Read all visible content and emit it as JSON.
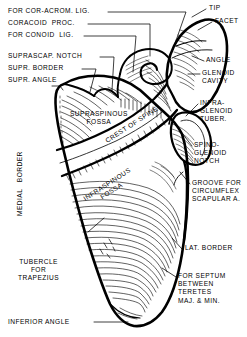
{
  "figure": {
    "view": "posterior",
    "bone": "scapula",
    "style": "line drawing with hatched shading",
    "ink_color": "#000000",
    "background_color": "#ffffff"
  },
  "labels": {
    "for_cor_acrom_lig": "FOR COR-ACROM. LIG.",
    "coracoid_proc": "CORACOID  PROC.",
    "for_conoid_lig": "FOR CONOID  LIG.",
    "suprascap_notch": "SUPRASCAP. NOTCH",
    "supr_border": "SUPR. BORDER",
    "supr_angle": "SUPR. ANGLE",
    "tip": "TIP",
    "facet": "FACET",
    "acromion": "ACROMION",
    "angle": "ANGLE",
    "glenoid_cavity": "GLENOID\nCAVITY",
    "infraglenoid_tuber": "INFRA-\nGLENOID\nTUBER.",
    "spinoglenoid_notch": "SPINO-\nGLENOID\nNOTCH",
    "groove_circumflex": "GROOVE FOR\nCIRCUMFLEX\nSCAPULAR A.",
    "lat_border": "LAT. BORDER",
    "septum_teretes": "FOR SEPTUM\nBETWEEN\nTERETES\nMAJ. & MIN.",
    "supraspinous_fossa": "SUPRASPINOUS\nFOSSA",
    "crest_of_spine": "CREST OF SPINE",
    "infraspinous_fossa": "INFRASPINOUS\nFOSSA",
    "medial_border": "MEDIAL   BORDER",
    "tubercle_for_trapezius": "TUBERCLE\nFOR\nTRAPEZIUS",
    "inferior_angle": "INFERIOR ANGLE"
  }
}
